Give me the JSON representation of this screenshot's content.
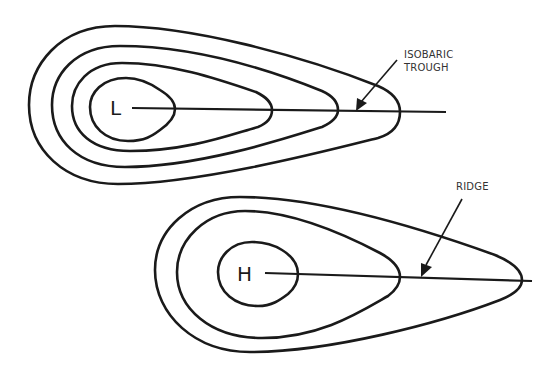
{
  "diagram": {
    "low_system": {
      "center_label": "L",
      "feature": "isobaric trough",
      "annotation": [
        "ISOBARIC",
        "TROUGH"
      ],
      "isobar_count": 4
    },
    "high_system": {
      "center_label": "H",
      "feature": "ridge",
      "annotation": [
        "RIDGE"
      ],
      "isobar_count": 3
    }
  },
  "colors": {
    "line": "#1a1a1a",
    "background": "#ffffff"
  }
}
